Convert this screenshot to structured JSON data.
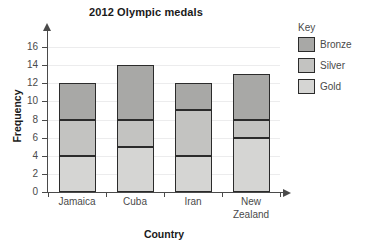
{
  "chart_data": {
    "type": "bar",
    "subtype": "stacked-bar",
    "title": "2012 Olympic medals",
    "xlabel": "Country",
    "ylabel": "Frequency",
    "categories": [
      "Jamaica",
      "Cuba",
      "Iran",
      "New Zealand"
    ],
    "category_lines": [
      [
        "Jamaica"
      ],
      [
        "Cuba"
      ],
      [
        "Iran"
      ],
      [
        "New",
        "Zealand"
      ]
    ],
    "series": [
      {
        "name": "Gold",
        "values": [
          4,
          5,
          4,
          6
        ],
        "color": "#d5d5d3"
      },
      {
        "name": "Silver",
        "values": [
          4,
          3,
          5,
          2
        ],
        "color": "#c3c3c1"
      },
      {
        "name": "Bronze",
        "values": [
          4,
          6,
          3,
          5
        ],
        "color": "#a8a8a6"
      }
    ],
    "totals": [
      12,
      14,
      12,
      13
    ],
    "stack_order_bottom_to_top": [
      "Gold",
      "Silver",
      "Bronze"
    ],
    "ylim": [
      0,
      16
    ],
    "ytick_step": 2,
    "yticks": [
      0,
      2,
      4,
      6,
      8,
      10,
      12,
      14,
      16
    ],
    "ytick_labels": [
      "0",
      "2",
      "4",
      "6",
      "8",
      "10",
      "12",
      "14",
      "16"
    ],
    "grid": true,
    "grid_axis": "y",
    "legend_position": "right",
    "legend_title": "Key",
    "legend_entries": [
      "Bronze",
      "Silver",
      "Gold"
    ]
  },
  "legend": {
    "title": "Key",
    "items": [
      {
        "label": "Bronze",
        "swatch": "bronze"
      },
      {
        "label": "Silver",
        "swatch": "silver"
      },
      {
        "label": "Gold",
        "swatch": "gold"
      }
    ]
  }
}
